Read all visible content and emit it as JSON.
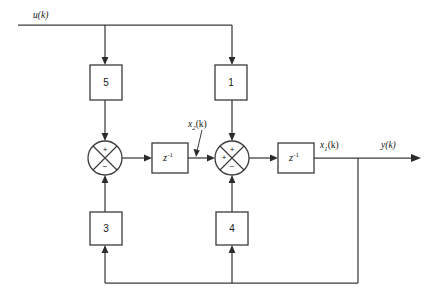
{
  "diagram": {
    "type": "signal-flow-block-diagram",
    "colors": {
      "line": "#3b3b3b",
      "text": "#161616",
      "background": "#ffffff"
    },
    "signals": {
      "input": "u(k)",
      "output": "y(k)",
      "state_1_var": "x",
      "state_1_sub": "1",
      "state_1_arg": "(k)",
      "state_2_var": "x",
      "state_2_sub": "2",
      "state_2_arg": "(k)"
    },
    "gain_blocks": [
      {
        "id": "gain-5",
        "label": "5",
        "x": 90,
        "y": 65,
        "w": 32,
        "h": 35
      },
      {
        "id": "gain-1",
        "label": "1",
        "x": 215,
        "y": 65,
        "w": 32,
        "h": 35
      },
      {
        "id": "gain-3",
        "label": "3",
        "x": 90,
        "y": 212,
        "w": 32,
        "h": 33
      },
      {
        "id": "gain-4",
        "label": "4",
        "x": 216,
        "y": 212,
        "w": 32,
        "h": 33
      }
    ],
    "delay_blocks": [
      {
        "id": "delay-1",
        "base": "z",
        "exponent": "-1",
        "x": 152,
        "y": 143,
        "w": 36,
        "h": 30
      },
      {
        "id": "delay-2",
        "base": "z",
        "exponent": "-1",
        "x": 278,
        "y": 143,
        "w": 36,
        "h": 30
      }
    ],
    "summing_junctions": [
      {
        "id": "summer-left",
        "cx": 105,
        "cy": 158,
        "r": 17,
        "signs": {
          "top": "+",
          "bottom": "−",
          "left": "",
          "right": ""
        }
      },
      {
        "id": "summer-right",
        "cx": 232,
        "cy": 158,
        "r": 17,
        "signs": {
          "top": "+",
          "bottom": "−",
          "left": "+",
          "right": ""
        }
      }
    ]
  }
}
